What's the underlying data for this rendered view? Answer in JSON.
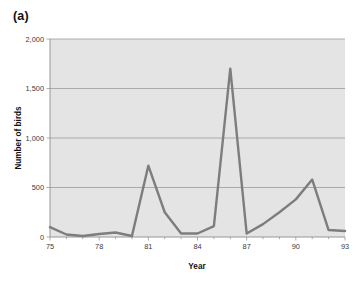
{
  "figure": {
    "panel_label": "(a)",
    "background_color": "#ffffff",
    "plot_background_color": "#e4e4e4",
    "line_color": "#7d7d7d",
    "grid_color": "#9a9a9a"
  },
  "chart_data": {
    "type": "line",
    "title": "",
    "subtitle": "",
    "xlabel": "Year",
    "ylabel": "Number of birds",
    "xlim": [
      75,
      93
    ],
    "ylim": [
      0,
      2000
    ],
    "grid": "horizontal",
    "legend": "none",
    "x_tick_labels": [
      "75",
      "78",
      "81",
      "84",
      "87",
      "90",
      "93"
    ],
    "x_tick_values": [
      75,
      78,
      81,
      84,
      87,
      90,
      93
    ],
    "y_tick_labels": [
      "0",
      "500",
      "1,000",
      "1,500",
      "2,000"
    ],
    "y_tick_values": [
      0,
      500,
      1000,
      1500,
      2000
    ],
    "x": [
      75,
      76,
      77,
      78,
      79,
      80,
      81,
      82,
      83,
      84,
      85,
      86,
      87,
      88,
      89,
      90,
      91,
      92,
      93
    ],
    "values": [
      100,
      25,
      10,
      30,
      45,
      10,
      720,
      250,
      35,
      35,
      110,
      1700,
      35,
      130,
      250,
      380,
      580,
      70,
      60
    ],
    "series": [
      {
        "name": "Number of birds",
        "values": [
          100,
          25,
          10,
          30,
          45,
          10,
          720,
          250,
          35,
          35,
          110,
          1700,
          35,
          130,
          250,
          380,
          580,
          70,
          60
        ]
      }
    ],
    "annotations": []
  }
}
